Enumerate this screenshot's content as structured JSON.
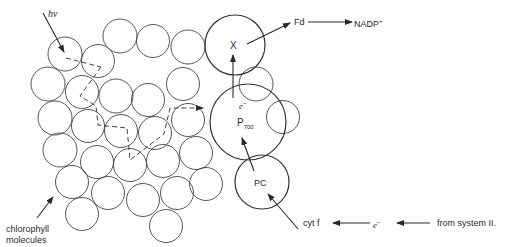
{
  "diagram": {
    "labels": {
      "photon": "hv",
      "x_center": "X",
      "p700_main": "P",
      "p700_sub": "700",
      "pc": "PC",
      "electron_up": "e",
      "electron_up_sup": "−",
      "fd": "Fd",
      "nadp_main": "NADP",
      "nadp_sup": "+",
      "cyt_f": "cyt f",
      "electron_mid": "e",
      "electron_mid_sup": "−",
      "from_system": "from system II.",
      "chlorophyll_line1": "chlorophyll",
      "chlorophyll_line2": "molecules"
    },
    "stroke_color": "#3a3a3a"
  }
}
